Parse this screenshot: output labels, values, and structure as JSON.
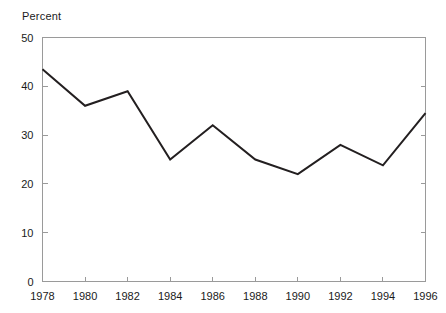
{
  "chart_data": {
    "type": "line",
    "title": "",
    "subtitle": "",
    "ylabel": "Percent",
    "xlabel": "",
    "x": [
      1978,
      1980,
      1982,
      1984,
      1986,
      1988,
      1990,
      1992,
      1994,
      1996
    ],
    "values": [
      43.5,
      36.0,
      39.0,
      25.0,
      32.0,
      25.0,
      22.0,
      28.0,
      23.8,
      34.5
    ],
    "series": [
      {
        "name": "Percent",
        "values": [
          43.5,
          36.0,
          39.0,
          25.0,
          32.0,
          25.0,
          22.0,
          28.0,
          23.8,
          34.5
        ]
      }
    ],
    "xtick_labels": [
      "1978",
      "1980",
      "1982",
      "1984",
      "1986",
      "1988",
      "1990",
      "1992",
      "1994",
      "1996"
    ],
    "ytick_labels": [
      "0",
      "10",
      "20",
      "30",
      "40",
      "50"
    ],
    "yticks": [
      0,
      10,
      20,
      30,
      40,
      50
    ],
    "ylim": [
      0,
      50
    ],
    "xlim": [
      1978,
      1996
    ],
    "grid": false,
    "legend": false,
    "legend_position": "none",
    "line_color": "#231f20",
    "frame_color": "#9a9a9a",
    "background_color": "#ffffff"
  },
  "axis": {
    "y_title": "Percent"
  }
}
